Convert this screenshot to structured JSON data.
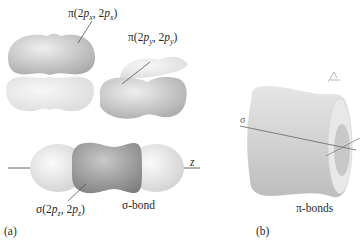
{
  "panel_a": {
    "panel_label": "(a)",
    "pi_x_label": {
      "prefix": "π(2",
      "p1": "p",
      "s1": "x",
      "mid": ", 2",
      "p2": "p",
      "s2": "x",
      "suffix": ")"
    },
    "pi_y_label": {
      "prefix": "π(2",
      "p1": "p",
      "s1": "y",
      "mid": ", 2",
      "p2": "p",
      "s2": "y",
      "suffix": ")"
    },
    "sigma_z_label": {
      "prefix": "σ(2",
      "p1": "p",
      "s1": "z",
      "mid": ", 2",
      "p2": "p",
      "s2": "z",
      "suffix": ")"
    },
    "sigma_bond_label": "σ-bond",
    "axis_label": "z"
  },
  "panel_b": {
    "panel_label": "(b)",
    "pi_bonds_label": "π-bonds",
    "sigma_glyph": "σ"
  },
  "colors": {
    "light_lobe": "#e2e2e2",
    "mid_lobe": "#c4c4c4",
    "dark_lobe": "#8f8f8f",
    "line": "#555555"
  }
}
